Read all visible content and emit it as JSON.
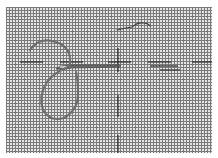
{
  "diagram": {
    "elements": [
      {
        "name": "canvas-mesh",
        "kind": "grid",
        "x": 6,
        "y": 7,
        "width": 206,
        "height": 146,
        "pitch_px": 3
      },
      {
        "name": "horizontal-guide-line",
        "kind": "dashed-line",
        "y": 62
      },
      {
        "name": "vertical-guide-line",
        "kind": "dashed-line",
        "x": 118
      },
      {
        "name": "needle",
        "kind": "needle",
        "from": [
          58,
          68
        ],
        "to": [
          118,
          66
        ]
      },
      {
        "name": "thread-loop",
        "kind": "thread"
      },
      {
        "name": "thread-tail",
        "kind": "thread"
      }
    ]
  },
  "colors": {
    "mesh": "#7a7a7a",
    "background": "#e6e6e6",
    "thread": "#6d6d6d",
    "needle": "#555555",
    "guide": "#2b2b2b"
  }
}
